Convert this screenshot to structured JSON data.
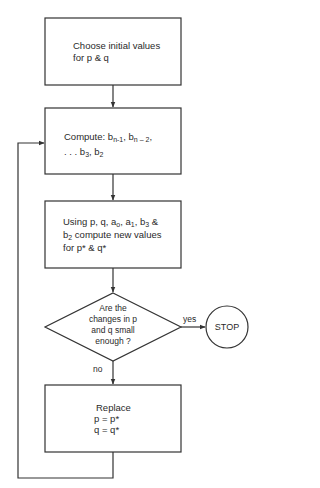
{
  "diagram": {
    "type": "flowchart",
    "nodes": [
      {
        "id": "init",
        "shape": "rectangle",
        "lines": [
          "Choose initial values",
          "for  p  &  q"
        ]
      },
      {
        "id": "compute_b",
        "shape": "rectangle",
        "line1_prefix": "Compute: b",
        "sub_n1": "n-1",
        "sep1": ", b",
        "sub_n2": "n – 2",
        "sep2": ",",
        "line2_prefix": ". . . b",
        "sub_3": "3",
        "sep3": ", b",
        "sub_2": "2"
      },
      {
        "id": "compute_pq",
        "shape": "rectangle",
        "l1_a": "Using p, q, a",
        "l1_sub_o": "o",
        "l1_b": ", a",
        "l1_sub_1": "1",
        "l1_c": ", b",
        "l1_sub_3": "3",
        "l1_d": " &",
        "l2_a": "b",
        "l2_sub_2": "2",
        "l2_b": " compute new values",
        "l3": "for p*  &  q*"
      },
      {
        "id": "decision",
        "shape": "diamond",
        "lines": [
          "Are the",
          "changes in p",
          "and q small",
          "enough ?"
        ]
      },
      {
        "id": "stop",
        "shape": "circle",
        "label": "STOP"
      },
      {
        "id": "replace",
        "shape": "rectangle",
        "lines": [
          "Replace",
          "p = p*",
          "q = q*"
        ]
      }
    ],
    "edges": [
      {
        "from": "init",
        "to": "compute_b",
        "label": ""
      },
      {
        "from": "compute_b",
        "to": "compute_pq",
        "label": ""
      },
      {
        "from": "compute_pq",
        "to": "decision",
        "label": ""
      },
      {
        "from": "decision",
        "to": "stop",
        "label": "yes"
      },
      {
        "from": "decision",
        "to": "replace",
        "label": "no"
      },
      {
        "from": "replace",
        "to": "compute_b",
        "label": ""
      }
    ],
    "labels": {
      "yes": "yes",
      "no": "no"
    },
    "colors": {
      "stroke": "#333333",
      "text": "#2a2a2a",
      "background": "#ffffff"
    }
  }
}
